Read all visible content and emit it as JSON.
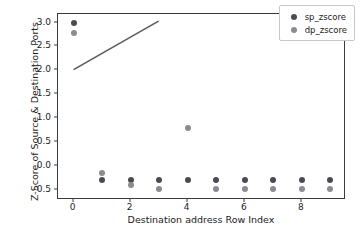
{
  "chart_data": {
    "type": "scatter",
    "title": "",
    "xlabel": "Destination address Row Index",
    "ylabel": "Z-Score of Source & Destination Ports",
    "xlim": [
      -0.55,
      9.55
    ],
    "ylim": [
      -0.72,
      3.18
    ],
    "xticks": [
      0,
      2,
      4,
      6,
      8
    ],
    "yticks": [
      -0.5,
      0.0,
      0.5,
      1.0,
      1.5,
      2.0,
      2.5,
      3.0
    ],
    "xticklabels": [
      "0",
      "2",
      "4",
      "6",
      "8"
    ],
    "yticklabels": [
      "-0.5",
      "0.0",
      "0.5",
      "1.0",
      "1.5",
      "2.0",
      "2.5",
      "3.0"
    ],
    "grid": false,
    "legend_position": "upper right",
    "x": [
      0,
      1,
      2,
      3,
      4,
      5,
      6,
      7,
      8,
      9
    ],
    "series": [
      {
        "name": "sp_zscore",
        "color": "#4a4a55",
        "values": [
          3.0,
          -0.31,
          -0.31,
          -0.31,
          -0.31,
          -0.31,
          -0.31,
          -0.31,
          -0.31,
          -0.31
        ]
      },
      {
        "name": "dp_zscore",
        "color": "#8b8b92",
        "values": [
          2.78,
          -0.16,
          -0.4,
          -0.48,
          0.79,
          -0.48,
          -0.48,
          -0.48,
          -0.48,
          -0.48
        ]
      }
    ],
    "annotations": [
      {
        "type": "line",
        "name": "trend-line",
        "color": "#595964",
        "x": [
          0.0,
          3.0
        ],
        "y": [
          2.0,
          3.03
        ]
      }
    ]
  },
  "legend": {
    "items": [
      {
        "label": "sp_zscore"
      },
      {
        "label": "dp_zscore"
      }
    ]
  }
}
